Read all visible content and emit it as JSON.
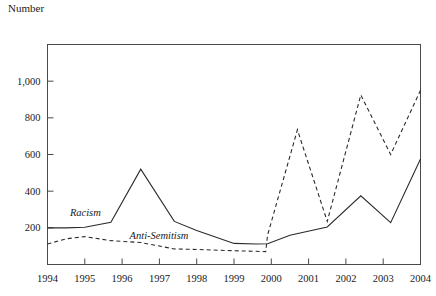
{
  "chart_data": {
    "type": "line",
    "title": "",
    "ylabel": "Number",
    "xlabel": "",
    "ylim": [
      0,
      1200
    ],
    "xlim": [
      1994,
      2004
    ],
    "grid": false,
    "legend_position": "inline-labels",
    "yticks": [
      "200",
      "400",
      "600",
      "800",
      "1,000"
    ],
    "ytick_values": [
      200,
      400,
      600,
      800,
      1000
    ],
    "xticks": [
      "1994",
      "1995",
      "1996",
      "1997",
      "1998",
      "1999",
      "2000",
      "2001",
      "2002",
      "2003",
      "2004"
    ],
    "xtick_values": [
      1994,
      1995,
      1996,
      1997,
      1998,
      1999,
      2000,
      2001,
      2002,
      2003,
      2004
    ],
    "series": [
      {
        "name": "Racism",
        "style": "solid",
        "color": "#2b2b2b",
        "x": [
          1994.0,
          1994.5,
          1995.0,
          1995.7,
          1996.5,
          1997.4,
          1998.0,
          1999.0,
          1999.6,
          1999.9,
          2000.5,
          2001.5,
          2002.4,
          2003.2,
          2004.0
        ],
        "values": [
          200,
          200,
          203,
          230,
          520,
          235,
          185,
          115,
          112,
          113,
          160,
          205,
          375,
          228,
          575
        ]
      },
      {
        "name": "Anti-Semitism",
        "style": "dashed",
        "color": "#2b2b2b",
        "x": [
          1994.0,
          1994.5,
          1995.0,
          1995.7,
          1996.5,
          1997.4,
          1998.0,
          1999.0,
          1999.6,
          1999.85,
          1999.9,
          2000.7,
          2001.5,
          2002.4,
          2003.2,
          2004.0
        ],
        "values": [
          112,
          140,
          152,
          130,
          120,
          85,
          82,
          75,
          72,
          70,
          160,
          735,
          235,
          925,
          600,
          950
        ]
      }
    ],
    "annotations": [
      {
        "text": "Racism",
        "x": 1994.6,
        "y": 262,
        "style": "italic"
      },
      {
        "text": "Anti-Semitism",
        "x": 1996.2,
        "y": 140,
        "style": "italic"
      }
    ]
  }
}
